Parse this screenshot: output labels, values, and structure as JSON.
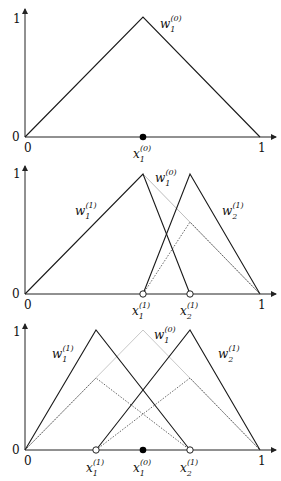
{
  "panels": [
    {
      "id": "level0",
      "y_ticks": [
        "1",
        "0"
      ],
      "x_ticks": [
        "0",
        "1"
      ],
      "curve_labels": [
        {
          "base": "w",
          "sub": "1",
          "sup": "(0)"
        }
      ],
      "point_labels": [
        {
          "base": "x",
          "sub": "1",
          "sup": "(0)",
          "marker": "filled"
        }
      ]
    },
    {
      "id": "level1",
      "y_ticks": [
        "1",
        "0"
      ],
      "x_ticks": [
        "0",
        "1"
      ],
      "curve_labels": [
        {
          "base": "w",
          "sub": "1",
          "sup": "(1)"
        },
        {
          "base": "w",
          "sub": "1",
          "sup": "(0)"
        },
        {
          "base": "w",
          "sub": "2",
          "sup": "(1)"
        }
      ],
      "point_labels": [
        {
          "base": "x",
          "sub": "1",
          "sup": "(1)",
          "marker": "open"
        },
        {
          "base": "x",
          "sub": "2",
          "sup": "(1)",
          "marker": "open"
        }
      ]
    },
    {
      "id": "level1-refined",
      "y_ticks": [
        "1",
        "0"
      ],
      "x_ticks": [
        "0",
        "1"
      ],
      "curve_labels": [
        {
          "base": "w",
          "sub": "1",
          "sup": "(1)"
        },
        {
          "base": "w",
          "sub": "1",
          "sup": "(0)"
        },
        {
          "base": "w",
          "sub": "2",
          "sup": "(1)"
        }
      ],
      "point_labels": [
        {
          "base": "x",
          "sub": "1",
          "sup": "(1)",
          "marker": "open"
        },
        {
          "base": "x",
          "sub": "1",
          "sup": "(0)",
          "marker": "filled"
        },
        {
          "base": "x",
          "sub": "2",
          "sup": "(1)",
          "marker": "open"
        }
      ]
    }
  ],
  "colors": {
    "solid": "#1a1a1a",
    "gray": "#bdbdbd",
    "dotted": "#555555"
  }
}
